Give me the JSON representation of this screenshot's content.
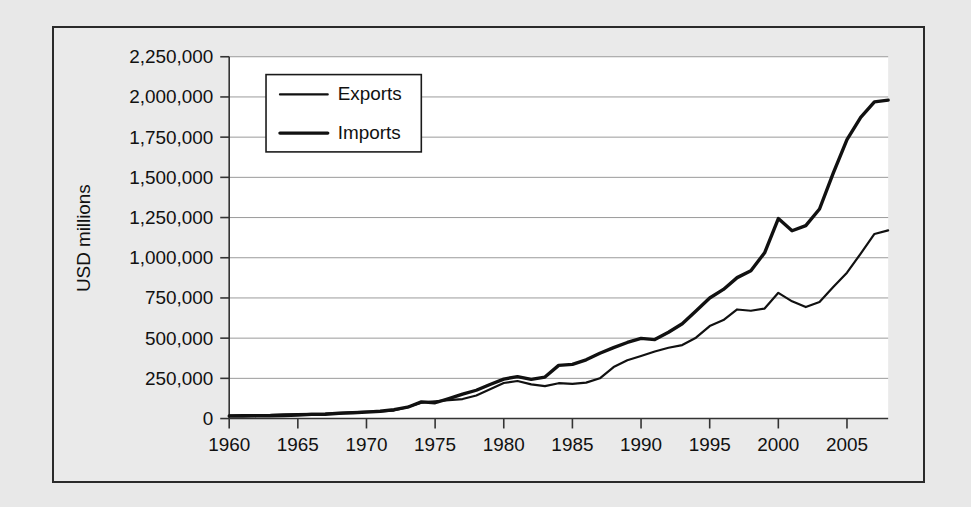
{
  "chart_data": {
    "type": "line",
    "title": "",
    "xlabel": "",
    "ylabel": "USD millions",
    "xlim": [
      1960,
      2008
    ],
    "ylim": [
      0,
      2250000
    ],
    "grid": true,
    "legend_position": "top-left-inside",
    "y_ticks": [
      0,
      250000,
      500000,
      750000,
      1000000,
      1250000,
      1500000,
      1750000,
      2000000,
      2250000
    ],
    "y_tick_labels": [
      "0",
      "250,000",
      "500,000",
      "750,000",
      "1,000,000",
      "1,250,000",
      "1,500,000",
      "1,750,000",
      "2,000,000",
      "2,250,000"
    ],
    "x_ticks": [
      1960,
      1965,
      1970,
      1975,
      1980,
      1985,
      1990,
      1995,
      2000,
      2005
    ],
    "x_tick_labels": [
      "1960",
      "1965",
      "1970",
      "1975",
      "1980",
      "1985",
      "1990",
      "1995",
      "2000",
      "2005"
    ],
    "x": [
      1960,
      1961,
      1962,
      1963,
      1964,
      1965,
      1966,
      1967,
      1968,
      1969,
      1970,
      1971,
      1972,
      1973,
      1974,
      1975,
      1976,
      1977,
      1978,
      1979,
      1980,
      1981,
      1982,
      1983,
      1984,
      1985,
      1986,
      1987,
      1988,
      1989,
      1990,
      1991,
      1992,
      1993,
      1994,
      1995,
      1996,
      1997,
      1998,
      1999,
      2000,
      2001,
      2002,
      2003,
      2004,
      2005,
      2006,
      2007,
      2008
    ],
    "series": [
      {
        "name": "Exports",
        "line_width": 2.2,
        "color": "#111111",
        "values": [
          20600,
          20900,
          21400,
          23000,
          26500,
          27500,
          30000,
          31000,
          34000,
          38000,
          43200,
          44100,
          49800,
          71300,
          98300,
          107700,
          115000,
          121200,
          143700,
          181800,
          220800,
          233700,
          212300,
          201800,
          219900,
          215900,
          223300,
          250200,
          320200,
          362100,
          389300,
          416900,
          440400,
          456900,
          502900,
          575200,
          612100,
          678400,
          670400,
          683900,
          781900,
          729100,
          693100,
          724800,
          818500,
          907200,
          1026000,
          1148000,
          1170000
        ]
      },
      {
        "name": "Imports",
        "line_width": 3.4,
        "color": "#111111",
        "values": [
          15100,
          15100,
          16400,
          17100,
          18700,
          21400,
          25600,
          26900,
          33000,
          36000,
          39900,
          45600,
          55800,
          70500,
          103800,
          98200,
          124200,
          151900,
          176000,
          212000,
          245300,
          261000,
          244000,
          258000,
          330700,
          336500,
          365400,
          406200,
          441000,
          473200,
          498300,
          491000,
          536500,
          589400,
          668700,
          749400,
          803100,
          876400,
          918600,
          1031000,
          1243500,
          1168000,
          1200200,
          1303100,
          1525700,
          1735100,
          1873400,
          1969400,
          1980000
        ]
      }
    ]
  },
  "legend": {
    "items": [
      {
        "label": "Exports"
      },
      {
        "label": "Imports"
      }
    ]
  },
  "axes": {
    "y_title": "USD millions"
  },
  "colors": {
    "page_background": "#e8e8e8",
    "figure_background": "#eaeaea",
    "plot_background": "#ffffff",
    "line": "#111111",
    "grid": "#9a9a9a",
    "frame": "#2a2a2a"
  }
}
